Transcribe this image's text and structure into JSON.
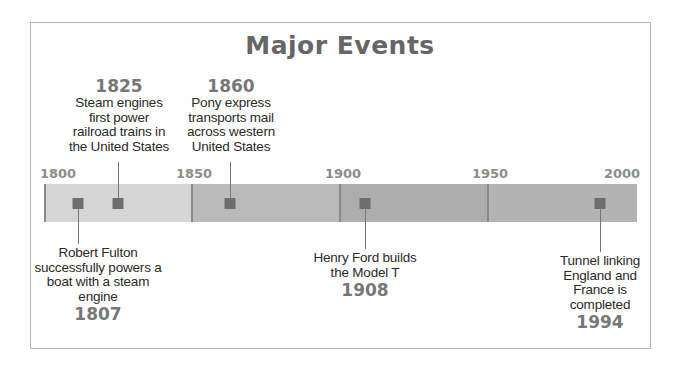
{
  "title": "Major Events",
  "axis": {
    "start": 1800,
    "end": 2000,
    "ticks": [
      "1800",
      "1850",
      "1900",
      "1950",
      "2000"
    ]
  },
  "colors": {
    "segment_1800_1850": "#d6d6d6",
    "segment_1850_1900": "#bababa",
    "segment_1900_1950": "#adadad",
    "segment_1950_2000": "#b3b3b3",
    "marker": "#6e6e6e",
    "divider": "#8a8a8a",
    "title": "#666666",
    "year_label": "#777777"
  },
  "events": [
    {
      "year": "1807",
      "position": "below",
      "description": "Robert Fulton successfully powers a boat with a steam engine",
      "lines": [
        "Robert Fulton",
        "successfully powers a",
        "boat with a steam",
        "engine"
      ]
    },
    {
      "year": "1825",
      "position": "above",
      "description": "Steam engines first power railroad trains in the United States",
      "lines": [
        "Steam engines",
        "first power",
        "railroad trains in",
        "the United States"
      ]
    },
    {
      "year": "1860",
      "position": "above",
      "description": "Pony express transports mail across western United States",
      "lines": [
        "Pony express",
        "transports mail",
        "across western",
        "United States"
      ]
    },
    {
      "year": "1908",
      "position": "below",
      "description": "Henry Ford builds the Model T",
      "lines": [
        "Henry Ford builds",
        "the Model T"
      ]
    },
    {
      "year": "1994",
      "position": "below",
      "description": "Tunnel linking England and France is completed",
      "lines": [
        "Tunnel linking",
        "England and",
        "France is",
        "completed"
      ]
    }
  ]
}
